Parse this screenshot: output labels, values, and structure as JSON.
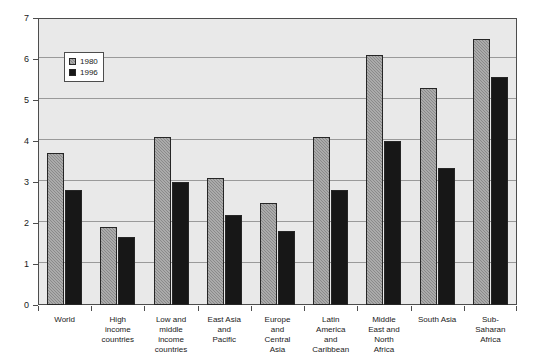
{
  "chart_data": {
    "type": "bar",
    "title": "",
    "subtitle": "",
    "xlabel": "",
    "ylabel": "",
    "ylim": [
      0,
      7
    ],
    "ytick_labels": [
      "0",
      "1",
      "2",
      "3",
      "4",
      "5",
      "6",
      "7"
    ],
    "ytick_values": [
      0,
      1,
      2,
      3,
      4,
      5,
      6,
      7
    ],
    "grid": true,
    "legend_position": "inside-top-left",
    "categories": [
      "World",
      "High income countries",
      "Low and middle income countries",
      "East Asia and Pacific",
      "Europe and Central Asia",
      "Latin America and Caribbean",
      "Middle East and North Africa",
      "South Asia",
      "Sub-Saharan Africa"
    ],
    "category_lines": [
      [
        "World"
      ],
      [
        "High",
        "income",
        "countries"
      ],
      [
        "Low and",
        "middle",
        "income",
        "countries"
      ],
      [
        "East Asia",
        "and",
        "Pacific"
      ],
      [
        "Europe",
        "and",
        "Central",
        "Asia"
      ],
      [
        "Latin",
        "America",
        "and",
        "Caribbean"
      ],
      [
        "Middle",
        "East and",
        "North",
        "Africa"
      ],
      [
        "South Asia"
      ],
      [
        "Sub-",
        "Saharan",
        "Africa"
      ]
    ],
    "series": [
      {
        "name": "1980",
        "color": "#8a8a8a",
        "values": [
          3.7,
          1.9,
          4.1,
          3.1,
          2.5,
          4.1,
          6.1,
          5.3,
          6.5
        ]
      },
      {
        "name": "1996",
        "color": "#171717",
        "values": [
          2.8,
          1.67,
          3.0,
          2.2,
          1.8,
          2.8,
          4.0,
          3.35,
          5.55
        ]
      }
    ]
  },
  "legend": {
    "entries": [
      {
        "label": "1980"
      },
      {
        "label": "1996"
      }
    ]
  }
}
